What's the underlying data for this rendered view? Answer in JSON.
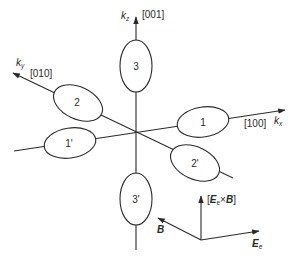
{
  "diagram": {
    "title": "",
    "axes": {
      "kz": {
        "symbol": "k",
        "subscript": "z",
        "direction": "[001]"
      },
      "ky": {
        "symbol": "k",
        "subscript": "y",
        "direction": "[010]"
      },
      "kx": {
        "symbol": "k",
        "subscript": "x",
        "direction": "[100]"
      }
    },
    "valleys": [
      {
        "id": "3",
        "label": "3"
      },
      {
        "id": "2",
        "label": "2"
      },
      {
        "id": "1",
        "label": "1"
      },
      {
        "id": "1p",
        "label": "1'"
      },
      {
        "id": "2p",
        "label": "2'"
      },
      {
        "id": "3p",
        "label": "3'"
      }
    ],
    "field_frame": {
      "up_label_open": "[",
      "up_label_E": "E",
      "up_label_E_sub": "e",
      "up_label_times": "×",
      "up_label_B": "B",
      "up_label_close": "]",
      "left_label": "B",
      "right_label": "E",
      "right_label_sub": "e"
    },
    "colors": {
      "line": "#2a2a2a",
      "background": "#ffffff"
    }
  }
}
